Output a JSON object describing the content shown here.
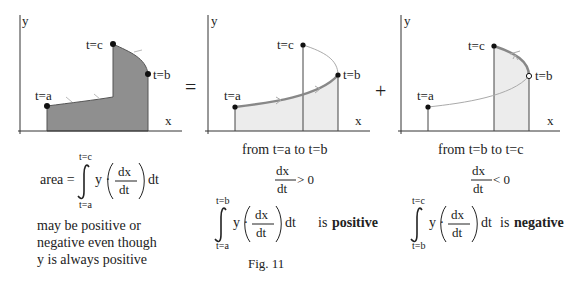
{
  "figure": {
    "caption": "Fig. 11",
    "colors": {
      "fill_dark": "#8f8f8f",
      "fill_light": "#ececec",
      "curve": "#888888",
      "axis": "#333333"
    },
    "operators": {
      "equals": "=",
      "plus": "+"
    },
    "panels": [
      {
        "id": "total",
        "axis_y": "y",
        "axis_x": "x",
        "points": {
          "a": "t=a",
          "b": "t=b",
          "c": "t=c"
        },
        "formula": {
          "lhs": "area =",
          "upper": "t=c",
          "lower": "t=a",
          "integrand": "y ·",
          "num": "dx",
          "den": "dt",
          "dt": "dt"
        },
        "note": [
          "may be positive or",
          "negative even though",
          "y is always positive"
        ]
      },
      {
        "id": "a-to-b",
        "axis_y": "y",
        "axis_x": "x",
        "points": {
          "a": "t=a",
          "b": "t=b",
          "c": "t=c"
        },
        "range_text": "from t=a  to  t=b",
        "derivative": {
          "num": "dx",
          "den": "dt",
          "rel": "> 0"
        },
        "formula": {
          "upper": "t=b",
          "lower": "t=a",
          "integrand": "y ·",
          "num": "dx",
          "den": "dt",
          "dt": "dt",
          "is": "is",
          "sign": "positive"
        }
      },
      {
        "id": "b-to-c",
        "axis_y": "y",
        "axis_x": "x",
        "points": {
          "a": "t=a",
          "b": "t=b",
          "c": "t=c"
        },
        "range_text": "from t=b  to  t=c",
        "derivative": {
          "num": "dx",
          "den": "dt",
          "rel": "< 0"
        },
        "formula": {
          "upper": "t=c",
          "lower": "t=b",
          "integrand": "y ·",
          "num": "dx",
          "den": "dt",
          "dt": "dt",
          "is": "is",
          "sign": "negative"
        }
      }
    ]
  }
}
